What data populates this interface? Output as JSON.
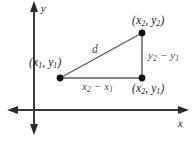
{
  "figure": {
    "background_color": "#ffffff",
    "axes": {
      "x_axis_label": "x",
      "y_axis_label": "y",
      "axis_color": "#3a3a3a",
      "x_axis_y": 110,
      "y_axis_x": 34
    },
    "points": [
      {
        "name": "point-x1-y1",
        "label_open": "(",
        "label_x": "x",
        "label_x_sub": "1",
        "label_comma": ",",
        "label_y": "y",
        "label_y_sub": "1",
        "label_close": ")",
        "px": 60,
        "py": 78
      },
      {
        "name": "point-x2-y2",
        "label_open": "(",
        "label_x": "x",
        "label_x_sub": "2",
        "label_comma": ",",
        "label_y": "y",
        "label_y_sub": "2",
        "label_close": ")",
        "px": 142,
        "py": 33
      },
      {
        "name": "point-x2-y1",
        "label_open": "(",
        "label_x": "x",
        "label_x_sub": "2",
        "label_comma": ",",
        "label_y": "y",
        "label_y_sub": "1",
        "label_close": ")",
        "px": 142,
        "py": 78
      }
    ],
    "labels": {
      "hypotenuse": "d",
      "vertical_leg_first": "y",
      "vertical_leg_first_sub": "2",
      "vertical_leg_minus": "−",
      "vertical_leg_second": "y",
      "vertical_leg_second_sub": "1",
      "horizontal_leg_first": "x",
      "horizontal_leg_first_sub": "2",
      "horizontal_leg_minus": "−",
      "horizontal_leg_second": "x",
      "horizontal_leg_second_sub": "1"
    },
    "colors": {
      "point_fill": "#111111",
      "triangle_stroke": "#4a4a4a",
      "leg_text": "#4a4a4a",
      "point_text": "#1a1a1a"
    }
  }
}
